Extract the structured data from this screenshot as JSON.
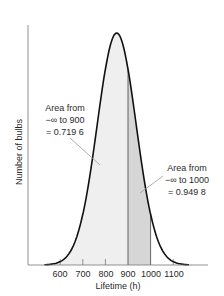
{
  "chart_data": {
    "type": "area",
    "title": "",
    "xlabel": "Lifetime (h)",
    "ylabel": "Number of bulbs",
    "xticks": [
      600,
      700,
      800,
      900,
      1000,
      1100
    ],
    "xlim": [
      520,
      1190
    ],
    "distribution": {
      "kind": "normal",
      "mean": 850,
      "sd": 86
    },
    "shaded_regions": [
      {
        "from": "-inf",
        "to": 900,
        "area": 0.7196,
        "color": "#efefef"
      },
      {
        "from": 900,
        "to": 1000,
        "area": 0.2302,
        "color": "#d9d9d9"
      }
    ],
    "grid": false,
    "annotations": [
      {
        "lines": [
          "Area from",
          "−∞ to 900",
          "= 0.719 6"
        ],
        "target_x": 900,
        "value": 0.7196
      },
      {
        "lines": [
          "Area from",
          "−∞ to 1000",
          "= 0.949 8"
        ],
        "target_x": 1000,
        "value": 0.9498
      }
    ]
  },
  "labels": {
    "xlabel": "Lifetime (h)",
    "ylabel": "Number of bulbs",
    "ticks": [
      "600",
      "700",
      "800",
      "900",
      "1000",
      "1100"
    ],
    "ann1": {
      "l1": "Area from",
      "l2": "−∞ to 900",
      "l3": "= 0.719 6"
    },
    "ann2": {
      "l1": "Area from",
      "l2": "−∞ to 1000",
      "l3": "= 0.949 8"
    }
  },
  "colors": {
    "curve": "#111111",
    "axis": "#555555",
    "fill_light": "#efefef",
    "fill_dark": "#d6d6d6",
    "leader": "#9a9a9a"
  }
}
